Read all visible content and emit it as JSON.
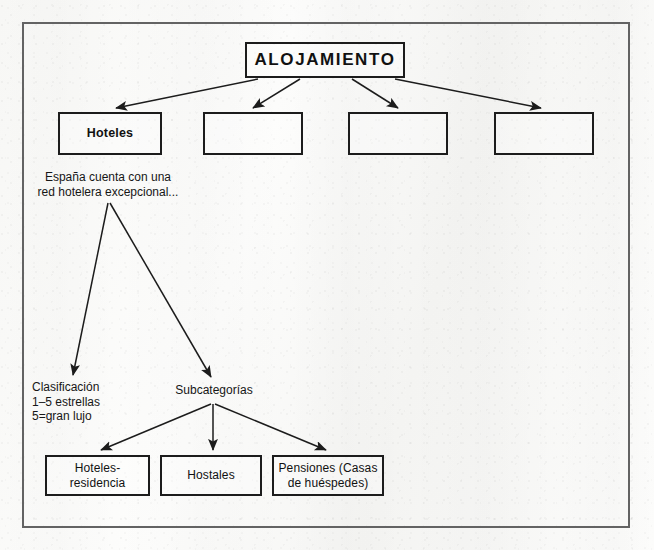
{
  "document": {
    "kind": "scanned-concept-diagram",
    "language": "es",
    "frame": {
      "border_color": "#636363"
    },
    "background_color": "#fbfbfa",
    "ink_color": "#1c1c1c"
  },
  "diagram": {
    "root": {
      "label": "ALOJAMIENTO",
      "x": 245,
      "y": 42,
      "w": 160,
      "h": 36
    },
    "level2": [
      {
        "label": "Hoteles",
        "x": 58,
        "y": 112,
        "w": 104,
        "h": 43,
        "empty": false
      },
      {
        "label": "",
        "x": 203,
        "y": 112,
        "w": 100,
        "h": 43,
        "empty": true
      },
      {
        "label": "",
        "x": 348,
        "y": 112,
        "w": 100,
        "h": 43,
        "empty": true
      },
      {
        "label": "",
        "x": 494,
        "y": 112,
        "w": 100,
        "h": 43,
        "empty": true
      }
    ],
    "notes": [
      {
        "name": "hoteles-note",
        "text": "España cuenta con una\nred hotelera excepcional...",
        "x": 18,
        "y": 170,
        "w": 180,
        "align": "center"
      },
      {
        "name": "clasificacion-note",
        "text": "Clasificación\n1–5 estrellas\n5=gran lujo",
        "x": 32,
        "y": 380,
        "w": 120,
        "align": "left"
      },
      {
        "name": "subcategorias-note",
        "text": "Subcategorías",
        "x": 168,
        "y": 383,
        "w": 92,
        "align": "center"
      }
    ],
    "leaves": [
      {
        "label": "Hoteles-\nresidencia",
        "x": 45,
        "y": 455,
        "w": 105,
        "h": 41
      },
      {
        "label": "Hostales",
        "x": 160,
        "y": 455,
        "w": 102,
        "h": 41
      },
      {
        "label": "Pensiones (Casas\nde huéspedes)",
        "x": 272,
        "y": 455,
        "w": 112,
        "h": 41
      }
    ],
    "arrows": [
      {
        "name": "root-to-hoteles",
        "x1": 258,
        "y1": 79,
        "x2": 116,
        "y2": 108
      },
      {
        "name": "root-to-empty-1",
        "x1": 300,
        "y1": 79,
        "x2": 253,
        "y2": 108
      },
      {
        "name": "root-to-empty-2",
        "x1": 352,
        "y1": 79,
        "x2": 398,
        "y2": 108
      },
      {
        "name": "root-to-empty-3",
        "x1": 395,
        "y1": 79,
        "x2": 541,
        "y2": 108
      },
      {
        "name": "note-to-clasificacion",
        "x1": 108,
        "y1": 203,
        "x2": 73,
        "y2": 375
      },
      {
        "name": "note-to-subcategorias",
        "x1": 110,
        "y1": 203,
        "x2": 211,
        "y2": 377
      },
      {
        "name": "sub-to-hoteles-residencia",
        "x1": 211,
        "y1": 404,
        "x2": 101,
        "y2": 450
      },
      {
        "name": "sub-to-hostales",
        "x1": 213,
        "y1": 404,
        "x2": 213,
        "y2": 450
      },
      {
        "name": "sub-to-pensiones",
        "x1": 215,
        "y1": 404,
        "x2": 326,
        "y2": 450
      }
    ]
  }
}
